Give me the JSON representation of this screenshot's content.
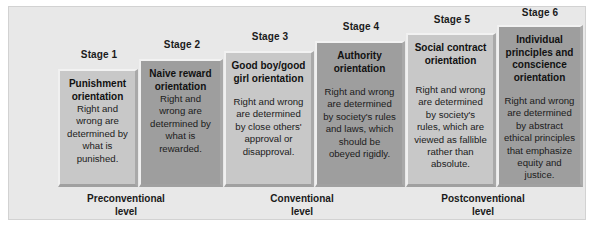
{
  "figure": {
    "background_color": "#e8e8e8",
    "box_light_color": "#c8c8c8",
    "box_dark_color": "#9e9e9e"
  },
  "stages": [
    {
      "label": "Stage 1",
      "title": "Punishment orientation",
      "description": "Right and wrong are determined by what is punished.",
      "shade": "light"
    },
    {
      "label": "Stage 2",
      "title": "Naive reward orientation",
      "description": "Right and wrong are determined by what is rewarded.",
      "shade": "dark"
    },
    {
      "label": "Stage 3",
      "title": "Good boy/good girl orientation",
      "description": "Right and wrong are determined by close others' approval or disapproval.",
      "shade": "light"
    },
    {
      "label": "Stage 4",
      "title": "Authority orientation",
      "description": "Right and wrong are determined by society's rules and laws, which should be obeyed rigidly.",
      "shade": "dark"
    },
    {
      "label": "Stage 5",
      "title": "Social contract orientation",
      "description": "Right and wrong are determined by society's rules, which are viewed as fallible rather than absolute.",
      "shade": "light"
    },
    {
      "label": "Stage 6",
      "title": "Individual principles and conscience orientation",
      "description": "Right and wrong are determined by abstract ethical principles that emphasize equity and justice.",
      "shade": "dark"
    }
  ],
  "levels": [
    {
      "line1": "Preconventional",
      "line2": "level"
    },
    {
      "line1": "Conventional",
      "line2": "level"
    },
    {
      "line1": "Postconventional",
      "line2": "level"
    }
  ]
}
